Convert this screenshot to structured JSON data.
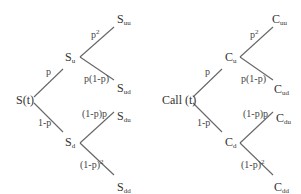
{
  "left_tree": {
    "root": "S(t)",
    "up": {
      "base": "S",
      "sub": "u"
    },
    "down": {
      "base": "S",
      "sub": "d"
    },
    "uu": {
      "base": "S",
      "sub": "uu"
    },
    "ud": {
      "base": "S",
      "sub": "ud"
    },
    "du": {
      "base": "S",
      "sub": "du"
    },
    "dd": {
      "base": "S",
      "sub": "dd"
    },
    "prob_up": "p",
    "prob_down": "1-p",
    "prob_uu": {
      "base": "p",
      "sup": "2"
    },
    "prob_ud": "p(1-p)",
    "prob_du": "(1-p)p",
    "prob_dd": {
      "base": "(1-p)",
      "sup": "2"
    }
  },
  "right_tree": {
    "root": "Call (t)",
    "up": {
      "base": "C",
      "sub": "u"
    },
    "down": {
      "base": "C",
      "sub": "d"
    },
    "uu": {
      "base": "C",
      "sub": "uu"
    },
    "ud": {
      "base": "C",
      "sub": "ud"
    },
    "du": {
      "base": "C",
      "sub": "du"
    },
    "dd": {
      "base": "C",
      "sub": "dd"
    },
    "prob_up": "p",
    "prob_down": "1-p",
    "prob_uu": {
      "base": "p",
      "sup": "2"
    },
    "prob_ud": "p(1-p)",
    "prob_du": "(1-p)p",
    "prob_dd": {
      "base": "(1-p)",
      "sup": "2"
    }
  }
}
